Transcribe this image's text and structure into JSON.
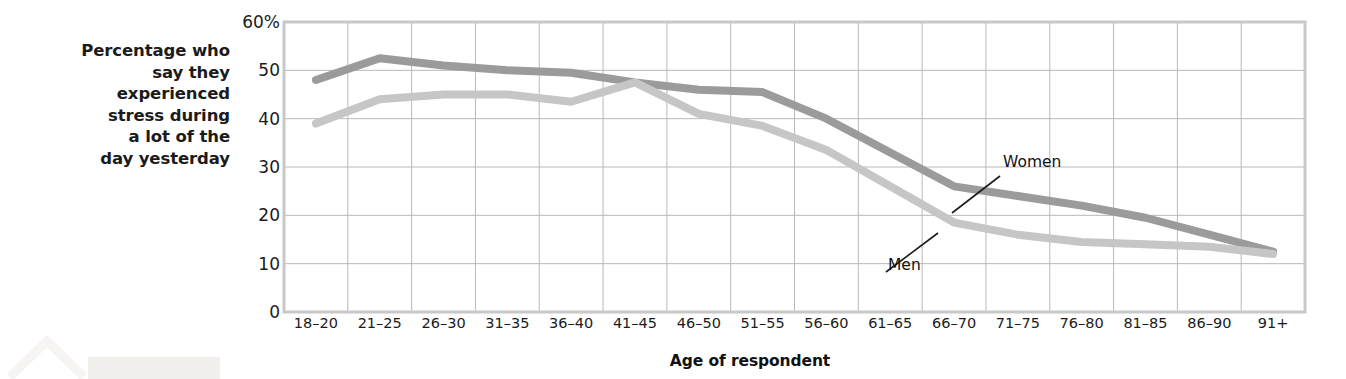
{
  "chart_data": {
    "type": "line",
    "title": "",
    "subtitle": "",
    "xlabel": "Age of respondent",
    "ylabel": "Percentage who say they experienced stress during a lot of the day yesterday",
    "ylabel_lines": [
      "Percentage who",
      "say they",
      "experienced",
      "stress during",
      "a lot of the",
      "day yesterday"
    ],
    "categories": [
      "18–20",
      "21–25",
      "26–30",
      "31–35",
      "36–40",
      "41–45",
      "46–50",
      "51–55",
      "56–60",
      "61–65",
      "66–70",
      "71–75",
      "76–80",
      "81–85",
      "86–90",
      "91+"
    ],
    "yticks": [
      "0",
      "10",
      "20",
      "30",
      "40",
      "50",
      "60%"
    ],
    "ytick_values": [
      0,
      10,
      20,
      30,
      40,
      50,
      60
    ],
    "ylim": [
      0,
      60
    ],
    "grid": true,
    "legend_position": "inline-annotation",
    "series": [
      {
        "name": "Women",
        "color": "#9b9b9b",
        "values": [
          48,
          52.5,
          51,
          50,
          49.5,
          47.5,
          46,
          45.5,
          40,
          33,
          26,
          24,
          22,
          19.5,
          16,
          12.5
        ]
      },
      {
        "name": "Men",
        "color": "#c6c6c6",
        "values": [
          39,
          44,
          45,
          45,
          43.5,
          47.5,
          41,
          38.5,
          33.5,
          26,
          18.5,
          16,
          14.5,
          14,
          13.5,
          12
        ]
      }
    ],
    "annotations": [
      {
        "label": "Women",
        "series": "Women",
        "at_category": "71–75"
      },
      {
        "label": "Men",
        "series": "Men",
        "at_category": "66–70"
      }
    ],
    "colors": {
      "women": "#9b9b9b",
      "men": "#c6c6c6",
      "grid": "#b9b9b9",
      "axis": "#c8c8c8",
      "text": "#1b1b1b",
      "background": "#ffffff"
    }
  }
}
